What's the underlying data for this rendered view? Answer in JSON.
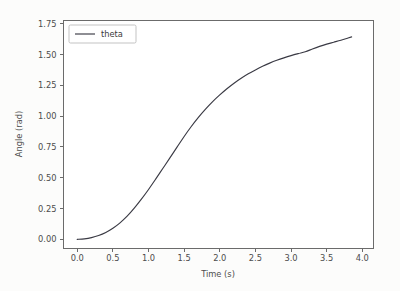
{
  "figure": {
    "background_color": "#fcfcfb",
    "plot_background_color": "#ffffff",
    "spine_color": "#6b6b6b",
    "width": 400,
    "height": 291
  },
  "chart_data": {
    "type": "line",
    "title": "",
    "xlabel": "Time (s)",
    "ylabel": "Angle (rad)",
    "xlim": [
      -0.2,
      4.15
    ],
    "ylim": [
      -0.07,
      1.78
    ],
    "xticks": [
      0.0,
      0.5,
      1.0,
      1.5,
      2.0,
      2.5,
      3.0,
      3.5,
      4.0
    ],
    "xticklabels": [
      "0.0",
      "0.5",
      "1.0",
      "1.5",
      "2.0",
      "2.5",
      "3.0",
      "3.5",
      "4.0"
    ],
    "yticks": [
      0.0,
      0.25,
      0.5,
      0.75,
      1.0,
      1.25,
      1.5,
      1.75
    ],
    "yticklabels": [
      "0.00",
      "0.25",
      "0.50",
      "0.75",
      "1.00",
      "1.25",
      "1.50",
      "1.75"
    ],
    "grid": false,
    "legend_position": "upper left",
    "legend_entries": [
      "theta"
    ],
    "series": [
      {
        "name": "theta",
        "color": "#3a3a44",
        "linewidth": 1.15,
        "x": [
          0.0,
          0.1,
          0.2,
          0.3,
          0.4,
          0.5,
          0.6,
          0.7,
          0.8,
          0.9,
          1.0,
          1.1,
          1.2,
          1.3,
          1.4,
          1.5,
          1.6,
          1.7,
          1.8,
          1.9,
          2.0,
          2.1,
          2.2,
          2.3,
          2.4,
          2.5,
          2.6,
          2.7,
          2.8,
          2.9,
          3.0,
          3.1,
          3.2,
          3.3,
          3.4,
          3.5,
          3.6,
          3.7,
          3.8,
          3.85
        ],
        "y": [
          0.0,
          0.004,
          0.014,
          0.031,
          0.056,
          0.09,
          0.134,
          0.188,
          0.253,
          0.326,
          0.405,
          0.489,
          0.575,
          0.661,
          0.748,
          0.835,
          0.916,
          0.99,
          1.057,
          1.118,
          1.172,
          1.222,
          1.267,
          1.307,
          1.343,
          1.375,
          1.404,
          1.43,
          1.453,
          1.473,
          1.491,
          1.507,
          1.522,
          1.545,
          1.566,
          1.584,
          1.6,
          1.616,
          1.634,
          1.643
        ]
      }
    ]
  }
}
